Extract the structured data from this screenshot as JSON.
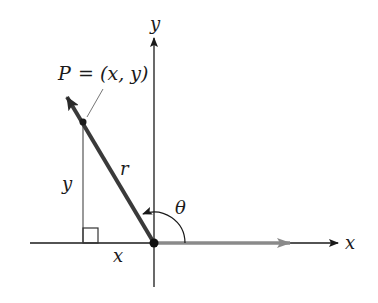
{
  "diagram": {
    "title": "",
    "axes": {
      "x_label": "x",
      "y_label": "y"
    },
    "point": {
      "name": "P",
      "equals": "=",
      "coords": "(x, y)"
    },
    "labels": {
      "hypotenuse": "r",
      "vertical_leg": "y",
      "horizontal_leg": "x",
      "angle": "θ"
    },
    "colors": {
      "axis": "#1a1a1a",
      "vector_r": "#3a3a3a",
      "vector_x": "#8a8a8a",
      "thin_lines": "#555555"
    }
  }
}
